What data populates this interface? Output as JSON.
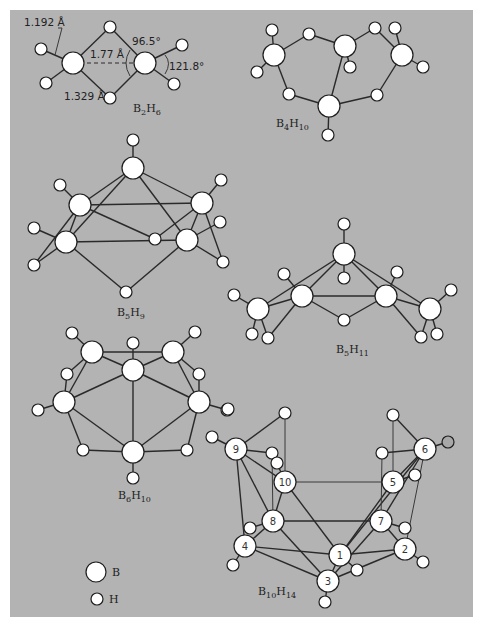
{
  "figure": {
    "background": "#b3b3b3",
    "atom_fill": "#ffffff",
    "bond_color": "#2a2a2a"
  },
  "molecules": [
    {
      "id": "b2h6",
      "formula": {
        "main": "B",
        "n1": "2",
        "mid": "H",
        "n2": "6"
      },
      "annotations": [
        {
          "text": "1.192 Å",
          "x": 24,
          "y": 26
        },
        {
          "text": "1.77 Å",
          "x": 90,
          "y": 58
        },
        {
          "text": "96.5°",
          "x": 132,
          "y": 45
        },
        {
          "text": "121.8°",
          "x": 169,
          "y": 70
        },
        {
          "text": "1.329 Å",
          "x": 64,
          "y": 100
        }
      ]
    },
    {
      "id": "b4h10",
      "formula": {
        "main": "B",
        "n1": "4",
        "mid": "H",
        "n2": "10"
      }
    },
    {
      "id": "b5h9",
      "formula": {
        "main": "B",
        "n1": "5",
        "mid": "H",
        "n2": "9"
      }
    },
    {
      "id": "b5h11",
      "formula": {
        "main": "B",
        "n1": "5",
        "mid": "H",
        "n2": "11"
      }
    },
    {
      "id": "b6h10",
      "formula": {
        "main": "B",
        "n1": "6",
        "mid": "H",
        "n2": "10"
      }
    },
    {
      "id": "b10h14",
      "formula": {
        "main": "B",
        "n1": "10",
        "mid": "H",
        "n2": "14"
      },
      "boron_numbers": [
        "1",
        "2",
        "3",
        "4",
        "5",
        "6",
        "7",
        "8",
        "9",
        "10"
      ]
    }
  ],
  "legend": {
    "boron": "B",
    "hydrogen": "H"
  }
}
